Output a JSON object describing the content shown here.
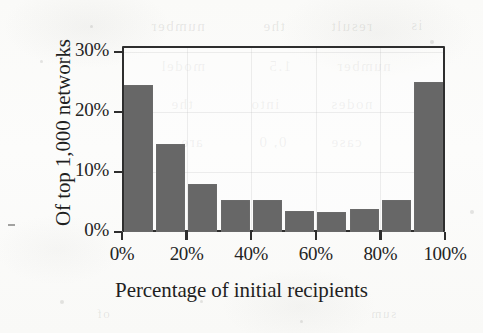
{
  "chart_data": {
    "type": "bar",
    "title": "",
    "xlabel": "Percentage of initial recipients",
    "ylabel": "Of top 1,000 networks",
    "categories": [
      "0-10%",
      "10-20%",
      "20-30%",
      "30-40%",
      "40-50%",
      "50-60%",
      "60-70%",
      "70-80%",
      "80-90%",
      "90-100%"
    ],
    "bin_edges": [
      0,
      10,
      20,
      30,
      40,
      50,
      60,
      70,
      80,
      90,
      100
    ],
    "values": [
      24.5,
      14.7,
      8.0,
      5.3,
      5.3,
      3.5,
      3.3,
      3.8,
      5.3,
      25.0
    ],
    "xlim": [
      0,
      100
    ],
    "ylim": [
      0,
      31
    ],
    "xtick_labels": [
      "0%",
      "20%",
      "40%",
      "60%",
      "80%",
      "100%"
    ],
    "xtick_values": [
      0,
      20,
      40,
      60,
      80,
      100
    ],
    "ytick_labels": [
      "0%",
      "10%",
      "20%",
      "30%"
    ],
    "ytick_values": [
      0,
      10,
      20,
      30
    ],
    "grid": true,
    "legend": null,
    "bar_color": "#676767",
    "axis_color": "#2e2e2e",
    "background_color": "#fbfbfa"
  },
  "scan_artifacts": {
    "bleed_lines": [
      {
        "text": "number",
        "left": 150,
        "top": 18,
        "size": 15
      },
      {
        "text": "the",
        "left": 262,
        "top": 18,
        "size": 15
      },
      {
        "text": "result",
        "left": 330,
        "top": 18,
        "size": 15
      },
      {
        "text": "is",
        "left": 410,
        "top": 18,
        "size": 14
      },
      {
        "text": "model",
        "left": 160,
        "top": 58,
        "size": 15
      },
      {
        "text": "1.5",
        "left": 268,
        "top": 58,
        "size": 15
      },
      {
        "text": "number",
        "left": 336,
        "top": 58,
        "size": 15
      },
      {
        "text": "the",
        "left": 170,
        "top": 96,
        "size": 15
      },
      {
        "text": "into",
        "left": 250,
        "top": 96,
        "size": 15
      },
      {
        "text": "nodes",
        "left": 330,
        "top": 96,
        "size": 15
      },
      {
        "text": "are",
        "left": 180,
        "top": 134,
        "size": 15
      },
      {
        "text": "0, 0",
        "left": 258,
        "top": 134,
        "size": 15
      },
      {
        "text": "case",
        "left": 330,
        "top": 134,
        "size": 15
      },
      {
        "text": "of",
        "left": 96,
        "top": 306,
        "size": 13
      },
      {
        "text": "sum",
        "left": 370,
        "top": 306,
        "size": 13
      }
    ]
  }
}
